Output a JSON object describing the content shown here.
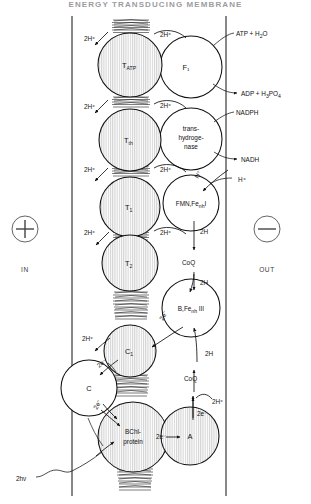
{
  "title": "ENERGY TRANSDUCING MEMBRANE",
  "sides": {
    "in": {
      "label": "IN",
      "sign": "+",
      "sign_name": "plus"
    },
    "out": {
      "label": "OUT",
      "sign": "−",
      "sign_name": "minus"
    }
  },
  "translocators": [
    {
      "id": "t-atp",
      "label": "T",
      "sub": "ATP",
      "cx": 130,
      "cy": 65,
      "r": 32
    },
    {
      "id": "t-th",
      "label": "T",
      "sub": "th",
      "cx": 130,
      "cy": 140,
      "r": 31
    },
    {
      "id": "t-1",
      "label": "T",
      "sub": "1",
      "cx": 130,
      "cy": 207,
      "r": 30
    },
    {
      "id": "t-2",
      "label": "T",
      "sub": "2",
      "cx": 130,
      "cy": 263,
      "r": 28
    },
    {
      "id": "c-1",
      "label": "C",
      "sub": "1",
      "cx": 130,
      "cy": 351,
      "r": 26
    }
  ],
  "carriers": [
    {
      "id": "f1",
      "label": "F₁",
      "cx": 191,
      "cy": 67,
      "r": 31
    },
    {
      "id": "transhydrogenase",
      "label": "trans-hydrogenase",
      "cx": 191,
      "cy": 139,
      "r": 31
    },
    {
      "id": "fmn",
      "label": "FMN,FeₙₕI",
      "cx": 191,
      "cy": 203,
      "r": 28
    },
    {
      "id": "b-fe",
      "label": "B,Feₙₕ III",
      "cx": 191,
      "cy": 308,
      "r": 29
    },
    {
      "id": "c",
      "label": "C",
      "cx": 89,
      "cy": 388,
      "r": 28
    },
    {
      "id": "bchl",
      "label": "BChl-protein",
      "cx": 133,
      "cy": 437,
      "r": 35
    },
    {
      "id": "a",
      "label": "A",
      "cx": 190,
      "cy": 436,
      "r": 29
    }
  ],
  "right_labels": [
    {
      "id": "atp-h2o",
      "text": "ATP + H₂O",
      "x": 236,
      "y": 34,
      "arrow": "none"
    },
    {
      "id": "adp-h3po4",
      "text": "ADP + H₃PO₄",
      "x": 241,
      "y": 95,
      "arrow": "in"
    },
    {
      "id": "nadph",
      "text": "NADPH",
      "x": 236,
      "y": 113,
      "arrow": "none"
    },
    {
      "id": "nadh",
      "text": "NADH",
      "x": 241,
      "y": 161,
      "arrow": "in"
    },
    {
      "id": "h-plus",
      "text": "H⁺",
      "x": 238,
      "y": 180,
      "arrow": "none"
    }
  ],
  "proton_labels": [
    {
      "id": "h-in-1",
      "text": "2H⁺",
      "x": 84,
      "y": 41
    },
    {
      "id": "h-out-1",
      "text": "2H⁺",
      "x": 160,
      "y": 37
    },
    {
      "id": "h-in-2",
      "text": "2H⁺",
      "x": 84,
      "y": 109
    },
    {
      "id": "h-out-2",
      "text": "2H⁺",
      "x": 160,
      "y": 108
    },
    {
      "id": "h-in-3",
      "text": "2H⁺",
      "x": 84,
      "y": 172
    },
    {
      "id": "h-out-3",
      "text": "2H⁺",
      "x": 160,
      "y": 172
    },
    {
      "id": "h-in-4",
      "text": "2H⁺",
      "x": 84,
      "y": 235
    },
    {
      "id": "h-out-4",
      "text": "2H⁺",
      "x": 160,
      "y": 235
    },
    {
      "id": "h-in-5",
      "text": "2H⁺",
      "x": 82,
      "y": 341
    },
    {
      "id": "h-out-5",
      "text": "2H⁺",
      "x": 212,
      "y": 404
    },
    {
      "id": "h-fmn",
      "text": "H⁺",
      "x": 198,
      "y": 179
    }
  ],
  "transfer_labels": [
    {
      "id": "2h-fmn-coq",
      "text": "2H",
      "x": 200,
      "y": 232
    },
    {
      "id": "coq-upper",
      "text": "CoQ",
      "x": 189,
      "y": 262
    },
    {
      "id": "2h-coq-b",
      "text": "2H",
      "x": 200,
      "y": 283
    },
    {
      "id": "2h-b-c1",
      "text": "2H",
      "x": 208,
      "y": 353
    },
    {
      "id": "coq-lower",
      "text": "CoQ",
      "x": 191,
      "y": 378
    },
    {
      "id": "2e-b-c1",
      "text": "2e⁻",
      "x": 163,
      "y": 319
    },
    {
      "id": "2e-c1-c",
      "text": "2e⁻",
      "x": 99,
      "y": 366
    },
    {
      "id": "2e-c-bchl",
      "text": "2e⁻",
      "x": 98,
      "y": 408
    },
    {
      "id": "2e-bchl-a",
      "text": "2e⁻",
      "x": 160,
      "y": 437
    },
    {
      "id": "2e-a-up",
      "text": "2e⁻",
      "x": 198,
      "y": 414
    }
  ],
  "photon": {
    "id": "photon",
    "text": "2hν",
    "x": 18,
    "y": 479
  },
  "colors": {
    "ink": "#111111",
    "muted": "#4a4a52",
    "paper": "#ffffff"
  }
}
